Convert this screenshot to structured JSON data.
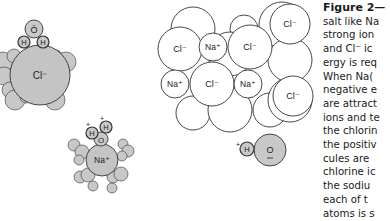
{
  "figure": {
    "caption_title": "Figure 2—",
    "caption_lines": [
      "salt like Na",
      "strong ion",
      "and Cl⁻ ic",
      "ergy is req",
      "When  Na(",
      "negative e",
      "are attract",
      "ions and te",
      "the chlorin",
      "the positiv",
      "cules  are",
      "chlorine ic",
      "the  sodiu",
      "each  of  t",
      "atoms is s"
    ]
  },
  "colors": {
    "water_fill": "#c8c8c8",
    "ion_fill_hydrated": "#c4c4c4",
    "crystal_fill": "#ffffff",
    "stroke": "#333333"
  },
  "labels": {
    "cl": "Cl⁻",
    "na": "Na⁺",
    "o": "O",
    "o_bar": "Ō",
    "h": "H",
    "plus": "+"
  },
  "hydrated_chloride": {
    "ion": {
      "cx": 40,
      "cy": 75,
      "r": 30,
      "label": "Cl⁻"
    },
    "water_molecule": {
      "o": {
        "cx": 34,
        "cy": 29,
        "r": 9,
        "label": "Ō"
      },
      "h": [
        {
          "cx": 24,
          "cy": 42,
          "r": 6
        },
        {
          "cx": 43,
          "cy": 42,
          "r": 6
        }
      ]
    },
    "shell": [
      {
        "cx": 3,
        "cy": 62,
        "r": 10
      },
      {
        "cx": 14,
        "cy": 56,
        "r": 7
      },
      {
        "cx": 4,
        "cy": 76,
        "r": 9
      },
      {
        "cx": 10,
        "cy": 90,
        "r": 8
      },
      {
        "cx": 15,
        "cy": 100,
        "r": 10
      },
      {
        "cx": 26,
        "cy": 97,
        "r": 6
      },
      {
        "cx": 45,
        "cy": 96,
        "r": 6
      },
      {
        "cx": 55,
        "cy": 100,
        "r": 10
      },
      {
        "cx": 58,
        "cy": 86,
        "r": 6
      },
      {
        "cx": 56,
        "cy": 56,
        "r": 6
      },
      {
        "cx": 66,
        "cy": 62,
        "r": 10
      }
    ]
  },
  "hydrated_sodium": {
    "ion": {
      "cx": 102,
      "cy": 160,
      "r": 16,
      "label": "Na⁺"
    },
    "water_molecule": {
      "o": {
        "cx": 101,
        "cy": 139,
        "r": 7,
        "label": "O"
      },
      "h": [
        {
          "cx": 92,
          "cy": 133,
          "r": 6
        },
        {
          "cx": 106,
          "cy": 127,
          "r": 6
        }
      ]
    },
    "shell": [
      {
        "cx": 74,
        "cy": 145,
        "r": 6
      },
      {
        "cx": 82,
        "cy": 152,
        "r": 7
      },
      {
        "cx": 79,
        "cy": 160,
        "r": 5
      },
      {
        "cx": 123,
        "cy": 144,
        "r": 5
      },
      {
        "cx": 128,
        "cy": 151,
        "r": 6
      },
      {
        "cx": 122,
        "cy": 156,
        "r": 5
      },
      {
        "cx": 80,
        "cy": 177,
        "r": 6
      },
      {
        "cx": 88,
        "cy": 175,
        "r": 7
      },
      {
        "cx": 93,
        "cy": 186,
        "r": 5
      },
      {
        "cx": 113,
        "cy": 177,
        "r": 6
      },
      {
        "cx": 121,
        "cy": 174,
        "r": 7
      },
      {
        "cx": 112,
        "cy": 188,
        "r": 5
      }
    ]
  },
  "crystal": {
    "back_atoms": [
      {
        "cx": 193,
        "cy": 29,
        "r": 22
      },
      {
        "cx": 244,
        "cy": 29,
        "r": 14
      },
      {
        "cx": 230,
        "cy": 54,
        "r": 22
      },
      {
        "cx": 282,
        "cy": 25,
        "r": 23
      },
      {
        "cx": 290,
        "cy": 60,
        "r": 22
      },
      {
        "cx": 193,
        "cy": 113,
        "r": 17
      },
      {
        "cx": 230,
        "cy": 110,
        "r": 22
      },
      {
        "cx": 270,
        "cy": 110,
        "r": 17
      },
      {
        "cx": 290,
        "cy": 100,
        "r": 22
      }
    ],
    "front_atoms": [
      {
        "cx": 180,
        "cy": 49,
        "r": 22,
        "label": "Cl⁻"
      },
      {
        "cx": 213,
        "cy": 47,
        "r": 14,
        "label": "Na⁺"
      },
      {
        "cx": 250,
        "cy": 47,
        "r": 22,
        "label": "Cl⁻"
      },
      {
        "cx": 290,
        "cy": 24,
        "r": 20,
        "label": "Cl⁻"
      },
      {
        "cx": 175,
        "cy": 84,
        "r": 14,
        "label": "Na⁺"
      },
      {
        "cx": 212,
        "cy": 84,
        "r": 22,
        "label": "Cl⁻"
      },
      {
        "cx": 248,
        "cy": 84,
        "r": 14,
        "label": "Na⁺"
      },
      {
        "cx": 293,
        "cy": 96,
        "r": 20,
        "label": "Cl⁻"
      }
    ]
  },
  "free_water": {
    "o": {
      "cx": 270,
      "cy": 150,
      "r": 16,
      "label": "O"
    },
    "h": {
      "cx": 247,
      "cy": 149,
      "r": 7,
      "label": "H"
    }
  }
}
